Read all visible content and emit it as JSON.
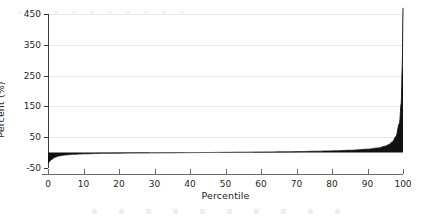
{
  "chart_data": {
    "type": "area",
    "title": "",
    "subtitle": "",
    "xlabel": "Percentile",
    "ylabel": "Percent (%)",
    "xlim": [
      0,
      100
    ],
    "ylim": [
      -50,
      450
    ],
    "xticks": [
      0,
      10,
      20,
      30,
      40,
      50,
      60,
      70,
      80,
      90,
      100
    ],
    "xtick_labels": [
      "0",
      "10",
      "20",
      "30",
      "40",
      "50",
      "60",
      "70",
      "80",
      "90",
      "100"
    ],
    "yticks": [
      -50,
      50,
      150,
      250,
      350,
      450
    ],
    "ytick_labels": [
      "-50",
      "50",
      "150",
      "250",
      "350",
      "450"
    ],
    "grid": "horizontal",
    "legend": "none",
    "fill_color": "#111111",
    "line_color": "#111111",
    "grid_color": "#ebe9e4",
    "axis_color": "#3a3a3a",
    "background_color": "#ffffff",
    "series": [
      {
        "name": "Percent change by percentile",
        "x": [
          0,
          0.5,
          1,
          2,
          3,
          4,
          5,
          7,
          10,
          15,
          20,
          25,
          30,
          35,
          40,
          45,
          50,
          55,
          60,
          65,
          70,
          75,
          80,
          85,
          90,
          93,
          95,
          96,
          97,
          98,
          99,
          99.5,
          99.8,
          100
        ],
        "values": [
          -35,
          -28,
          -22,
          -15,
          -11,
          -9,
          -7.5,
          -5.5,
          -4,
          -2.5,
          -1.8,
          -1.2,
          -0.8,
          -0.4,
          0,
          0.4,
          0.8,
          1.2,
          1.8,
          2.4,
          3.2,
          4.2,
          5.6,
          7.5,
          11,
          15,
          21,
          26,
          35,
          52,
          95,
          160,
          280,
          470
        ]
      }
    ]
  }
}
